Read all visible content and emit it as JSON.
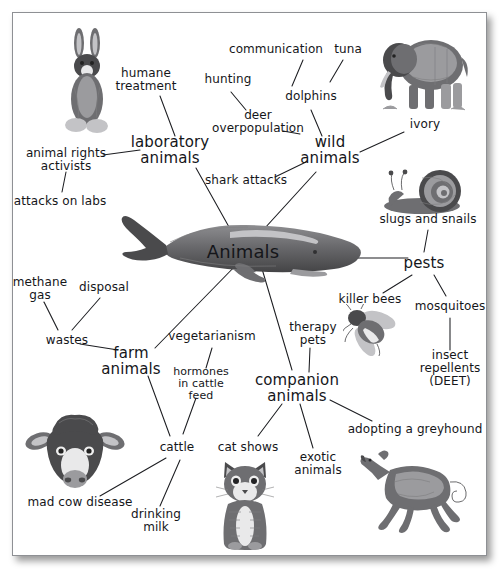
{
  "diagram": {
    "type": "concept-map",
    "center": {
      "label": "Animals",
      "x": 243,
      "y": 252
    },
    "branches": [
      {
        "id": "laboratory-animals",
        "label": "laboratory\nanimals",
        "x": 170,
        "y": 150,
        "children": [
          {
            "id": "humane-treatment",
            "label": "humane\ntreatment",
            "x": 146,
            "y": 80
          },
          {
            "id": "animal-rights-activists",
            "label": "animal rights\nactivists",
            "x": 66,
            "y": 160
          },
          {
            "id": "attacks-on-labs",
            "label": "attacks on labs",
            "x": 60,
            "y": 201
          }
        ]
      },
      {
        "id": "wild-animals",
        "label": "wild\nanimals",
        "x": 330,
        "y": 150,
        "children": [
          {
            "id": "dolphins",
            "label": "dolphins",
            "x": 311,
            "y": 96
          },
          {
            "id": "communication",
            "label": "communication",
            "x": 276,
            "y": 49
          },
          {
            "id": "tuna",
            "label": "tuna",
            "x": 348,
            "y": 49
          },
          {
            "id": "deer-overpopulation",
            "label": "deer\noverpopulation",
            "x": 258,
            "y": 122
          },
          {
            "id": "hunting",
            "label": "hunting",
            "x": 228,
            "y": 79
          },
          {
            "id": "shark-attacks",
            "label": "shark attacks",
            "x": 246,
            "y": 180
          },
          {
            "id": "ivory",
            "label": "ivory",
            "x": 425,
            "y": 124
          }
        ]
      },
      {
        "id": "pests",
        "label": "pests",
        "x": 424,
        "y": 263,
        "children": [
          {
            "id": "slugs-and-snails",
            "label": "slugs and snails",
            "x": 428,
            "y": 219
          },
          {
            "id": "killer-bees",
            "label": "killer bees",
            "x": 370,
            "y": 299
          },
          {
            "id": "mosquitoes",
            "label": "mosquitoes",
            "x": 450,
            "y": 306
          },
          {
            "id": "insect-repellents",
            "label": "insect\nrepellents\n(DEET)",
            "x": 450,
            "y": 368
          }
        ]
      },
      {
        "id": "farm-animals",
        "label": "farm\nanimals",
        "x": 131,
        "y": 361,
        "children": [
          {
            "id": "wastes",
            "label": "wastes",
            "x": 67,
            "y": 340
          },
          {
            "id": "methane-gas",
            "label": "methane\ngas",
            "x": 40,
            "y": 289
          },
          {
            "id": "disposal",
            "label": "disposal",
            "x": 104,
            "y": 287
          },
          {
            "id": "cattle",
            "label": "cattle",
            "x": 177,
            "y": 447
          },
          {
            "id": "hormones-in-cattle-feed",
            "label": "hormones\nin cattle\nfeed",
            "x": 201,
            "y": 384
          },
          {
            "id": "vegetarianism",
            "label": "vegetarianism",
            "x": 212,
            "y": 336
          },
          {
            "id": "mad-cow-disease",
            "label": "mad cow disease",
            "x": 80,
            "y": 502
          },
          {
            "id": "drinking-milk",
            "label": "drinking\nmilk",
            "x": 156,
            "y": 521
          }
        ]
      },
      {
        "id": "companion-animals",
        "label": "companion\nanimals",
        "x": 297,
        "y": 388,
        "children": [
          {
            "id": "therapy-pets",
            "label": "therapy\npets",
            "x": 313,
            "y": 334
          },
          {
            "id": "cat-shows",
            "label": "cat shows",
            "x": 248,
            "y": 447
          },
          {
            "id": "exotic-animals",
            "label": "exotic\nanimals",
            "x": 318,
            "y": 464
          },
          {
            "id": "adopting-a-greyhound",
            "label": "adopting a greyhound",
            "x": 415,
            "y": 429
          }
        ]
      }
    ],
    "pictures": [
      {
        "id": "rabbit-picture",
        "name": "rabbit",
        "x": 87,
        "y": 84,
        "w": 62,
        "h": 114
      },
      {
        "id": "elephant-picture",
        "name": "elephant",
        "x": 423,
        "y": 73,
        "w": 100,
        "h": 88
      },
      {
        "id": "snail-picture",
        "name": "snail",
        "x": 428,
        "y": 192,
        "w": 92,
        "h": 48
      },
      {
        "id": "whale-picture",
        "name": "whale",
        "x": 236,
        "y": 250,
        "w": 252,
        "h": 76
      },
      {
        "id": "bee-picture",
        "name": "bee",
        "x": 371,
        "y": 330,
        "w": 56,
        "h": 52
      },
      {
        "id": "cow-picture",
        "name": "cow-head",
        "x": 75,
        "y": 452,
        "w": 100,
        "h": 78
      },
      {
        "id": "kitten-picture",
        "name": "kitten",
        "x": 245,
        "y": 505,
        "w": 62,
        "h": 90
      },
      {
        "id": "greyhound-picture",
        "name": "greyhound",
        "x": 415,
        "y": 491,
        "w": 110,
        "h": 86
      }
    ],
    "edges": [
      [
        243,
        252,
        196,
        168
      ],
      [
        175,
        136,
        160,
        96
      ],
      [
        140,
        150,
        103,
        155
      ],
      [
        66,
        172,
        62,
        192
      ],
      [
        243,
        252,
        316,
        172
      ],
      [
        311,
        110,
        322,
        136
      ],
      [
        292,
        86,
        303,
        60
      ],
      [
        330,
        82,
        343,
        60
      ],
      [
        300,
        134,
        283,
        131
      ],
      [
        246,
        110,
        231,
        92
      ],
      [
        306,
        162,
        275,
        177
      ],
      [
        360,
        152,
        404,
        132
      ],
      [
        355,
        258,
        408,
        258
      ],
      [
        424,
        252,
        428,
        230
      ],
      [
        412,
        275,
        383,
        293
      ],
      [
        434,
        275,
        446,
        296
      ],
      [
        450,
        318,
        450,
        350
      ],
      [
        243,
        258,
        155,
        348
      ],
      [
        118,
        350,
        80,
        344
      ],
      [
        58,
        330,
        44,
        302
      ],
      [
        72,
        330,
        100,
        298
      ],
      [
        148,
        376,
        170,
        436
      ],
      [
        196,
        398,
        183,
        434
      ],
      [
        212,
        348,
        206,
        368
      ],
      [
        166,
        458,
        100,
        496
      ],
      [
        180,
        460,
        160,
        506
      ],
      [
        260,
        262,
        292,
        370
      ],
      [
        310,
        348,
        309,
        372
      ],
      [
        282,
        404,
        258,
        436
      ],
      [
        300,
        404,
        313,
        448
      ],
      [
        330,
        400,
        372,
        421
      ]
    ]
  }
}
